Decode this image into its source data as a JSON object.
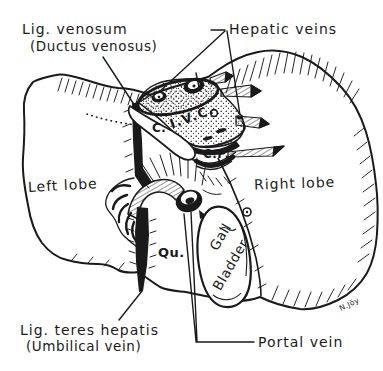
{
  "figure": {
    "title_meaning": "Posterior view of the liver, labeled line drawing",
    "colors": {
      "ink": "#1a1a1a",
      "paper": "#ffffff"
    },
    "labels": {
      "lig_venosum_line1": "Lig. venosum",
      "lig_venosum_line2": "(Ductus venosus)",
      "hepatic_veins": "Hepatic veins",
      "left_lobe": "Left lobe",
      "right_lobe": "Right lobe",
      "caudate_lobe_abbr": "C.",
      "ivc_abbr": "I.V.C.",
      "caudate_process_abbr": "C.P.",
      "quadrate_lobe_abbr": "Qu.",
      "gall_bladder_line1": "Gall",
      "gall_bladder_line2": "Bladder",
      "lig_teres_line1": "Lig. teres hepatis",
      "lig_teres_line2": "(Umbilical vein)",
      "portal_vein": "Portal vein",
      "artist_signature": "N.Jöy"
    }
  }
}
